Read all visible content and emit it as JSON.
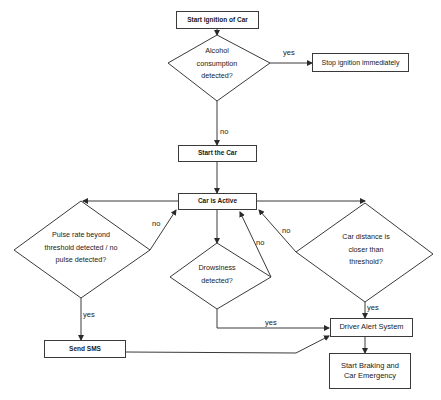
{
  "nodes": {
    "start_ignition": "Start ignition of Car",
    "alcohol_decision": "Alcohol consumption detected?",
    "stop_ignition": "Stop ignition immediately",
    "start_car": "Start the Car",
    "car_active": "Car is Active",
    "pulse_decision": "Pulse rate beyond threshold detected / no pulse detected?",
    "drowsiness_decision": "Drowsiness detected?",
    "distance_decision": "Car distance is closer than threshold?",
    "driver_alert": "Driver Alert System",
    "braking": "Start Braking and Car Emergency",
    "send_sms": "Send SMS"
  },
  "edges": {
    "alcohol_yes": "yes",
    "alcohol_no": "no",
    "pulse_no": "no",
    "pulse_yes": "yes",
    "drowsiness_no": "no",
    "drowsiness_yes": "yes",
    "distance_no": "no",
    "distance_yes": "yes"
  },
  "colors": {
    "line": "#3a3a3a",
    "background": "#ffffff"
  }
}
